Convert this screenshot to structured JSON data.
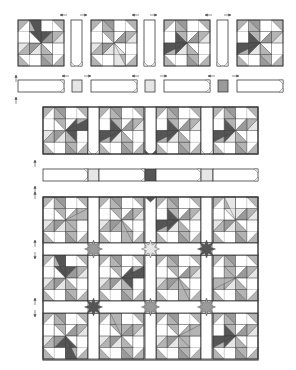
{
  "title": "Quilt assembly diagram",
  "colors": {
    "outline": "#3a3a3a",
    "white": "#ffffff",
    "light": "#e6e6e6",
    "medium": "#b4b4b4",
    "mid2": "#9a9a9a",
    "dark": "#555555",
    "arrow": "#444444"
  },
  "top_unit": {
    "label": "Block row with sashing (exploded)",
    "blocks": [
      {
        "x": 18,
        "y": 20,
        "size": 46,
        "accent": "dark",
        "accent_pos": 0
      },
      {
        "x": 91,
        "y": 20,
        "size": 46,
        "accent": "light",
        "accent_pos": 2
      },
      {
        "x": 164,
        "y": 20,
        "size": 46,
        "accent": "dark",
        "accent_pos": 3
      },
      {
        "x": 237,
        "y": 20,
        "size": 46,
        "accent": "dark",
        "accent_pos": 3
      }
    ],
    "sashes": [
      {
        "x": 71,
        "y": 20,
        "w": 11,
        "h": 46
      },
      {
        "x": 144,
        "y": 20,
        "w": 11,
        "h": 46
      },
      {
        "x": 217,
        "y": 20,
        "w": 11,
        "h": 46
      }
    ],
    "strip": {
      "y": 80,
      "h": 12,
      "pieces": [
        {
          "x": 18,
          "w": 46,
          "kind": "sash"
        },
        {
          "x": 72,
          "w": 10,
          "kind": "corner",
          "shade": "light"
        },
        {
          "x": 91,
          "w": 46,
          "kind": "sash"
        },
        {
          "x": 145,
          "w": 10,
          "kind": "corner",
          "shade": "light"
        },
        {
          "x": 164,
          "w": 46,
          "kind": "sash"
        },
        {
          "x": 218,
          "w": 10,
          "kind": "corner",
          "shade": "mid2"
        },
        {
          "x": 237,
          "w": 46,
          "kind": "sash"
        }
      ]
    },
    "arrows": [
      {
        "x": 60,
        "y": 15,
        "dir": "left"
      },
      {
        "x": 80,
        "y": 15,
        "dir": "right"
      },
      {
        "x": 132,
        "y": 15,
        "dir": "left"
      },
      {
        "x": 150,
        "y": 15,
        "dir": "right"
      },
      {
        "x": 205,
        "y": 15,
        "dir": "left"
      },
      {
        "x": 224,
        "y": 15,
        "dir": "right"
      },
      {
        "x": 62,
        "y": 76,
        "dir": "left"
      },
      {
        "x": 84,
        "y": 76,
        "dir": "right"
      },
      {
        "x": 132,
        "y": 76,
        "dir": "left"
      },
      {
        "x": 160,
        "y": 76,
        "dir": "right"
      },
      {
        "x": 208,
        "y": 76,
        "dir": "left"
      },
      {
        "x": 232,
        "y": 76,
        "dir": "right"
      },
      {
        "x": 16,
        "y": 75,
        "dir": "up"
      },
      {
        "x": 16,
        "y": 97,
        "dir": "up"
      }
    ]
  },
  "middle_unit": {
    "label": "Assembled row and sashing strip",
    "row": {
      "x": 43,
      "y": 107,
      "h": 47
    },
    "blocks": [
      {
        "x": 43,
        "size": 45,
        "accent": "dark",
        "accent_pos": 1
      },
      {
        "x": 99,
        "size": 45,
        "accent": "dark",
        "accent_pos": 3
      },
      {
        "x": 156,
        "size": 45,
        "accent": "dark",
        "accent_pos": 3
      },
      {
        "x": 213,
        "size": 45,
        "accent": "dark",
        "accent_pos": 3
      }
    ],
    "sashes": [
      {
        "x": 88,
        "w": 11,
        "end": "none"
      },
      {
        "x": 145,
        "w": 11,
        "end": "dark"
      },
      {
        "x": 201,
        "w": 12,
        "end": "none"
      }
    ],
    "strip": {
      "y": 169,
      "h": 12,
      "pieces": [
        {
          "x": 43,
          "w": 45,
          "kind": "sash"
        },
        {
          "x": 88,
          "w": 11,
          "kind": "corner",
          "shade": "light"
        },
        {
          "x": 99,
          "w": 46,
          "kind": "sash"
        },
        {
          "x": 145,
          "w": 11,
          "kind": "corner",
          "shade": "dark"
        },
        {
          "x": 156,
          "w": 45,
          "kind": "sash"
        },
        {
          "x": 201,
          "w": 12,
          "kind": "corner",
          "shade": "light"
        },
        {
          "x": 213,
          "w": 45,
          "kind": "sash"
        }
      ]
    },
    "arrows": [
      {
        "x": 35,
        "y": 160,
        "dir": "up"
      },
      {
        "x": 35,
        "y": 186,
        "dir": "up"
      }
    ]
  },
  "bottom_unit": {
    "label": "Quilt top",
    "x": 43,
    "y": 197,
    "w": 215,
    "h": 163,
    "row_ys": [
      197,
      255,
      313
    ],
    "block_h": 46,
    "sash_ys": [
      243,
      301
    ],
    "sash_h": 12,
    "col_xs": [
      43,
      99,
      156,
      213
    ],
    "block_w": 45,
    "vsash_xs": [
      88,
      145,
      201
    ],
    "vsash_w": 11,
    "block_accents": [
      [
        {
          "accent": "medium",
          "pos": 1
        },
        {
          "accent": "medium",
          "pos": 2
        },
        {
          "accent": "dark",
          "pos": 3
        },
        {
          "accent": "light",
          "pos": 0
        }
      ],
      [
        {
          "accent": "dark",
          "pos": 0
        },
        {
          "accent": "dark",
          "pos": 1
        },
        {
          "accent": "medium",
          "pos": 2
        },
        {
          "accent": "medium",
          "pos": 3
        }
      ],
      [
        {
          "accent": "dark",
          "pos": 2
        },
        {
          "accent": "medium",
          "pos": 0
        },
        {
          "accent": "medium",
          "pos": 1
        },
        {
          "accent": "dark",
          "pos": 3
        }
      ]
    ],
    "stars": [
      [
        {
          "shade": "mid2"
        },
        {
          "shade": "light"
        },
        {
          "shade": "dark"
        }
      ],
      [
        {
          "shade": "dark"
        },
        {
          "shade": "mid2"
        },
        {
          "shade": "mid2"
        }
      ]
    ],
    "top_edge_stars": [
      {
        "col": 1,
        "shade": "dark"
      }
    ],
    "arrows": [
      {
        "x": 35,
        "y": 240,
        "dir": "up"
      },
      {
        "x": 35,
        "y": 252,
        "dir": "down"
      },
      {
        "x": 35,
        "y": 298,
        "dir": "up"
      },
      {
        "x": 35,
        "y": 310,
        "dir": "down"
      },
      {
        "x": 35,
        "y": 192,
        "dir": "up"
      }
    ]
  }
}
